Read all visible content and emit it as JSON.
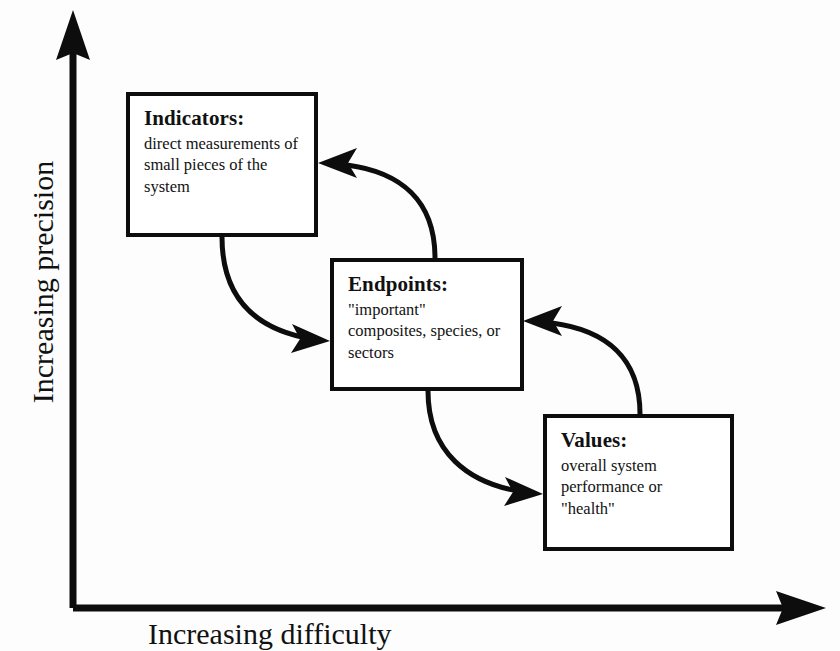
{
  "figure": {
    "background_color": "#fdfdfd",
    "ink_color": "#0d0d0d"
  },
  "axes": {
    "y": {
      "label": "Increasing precision",
      "arrow_direction": "up",
      "name": "y-axis"
    },
    "x": {
      "label": "Increasing difficulty",
      "arrow_direction": "right",
      "name": "x-axis"
    }
  },
  "boxes": [
    {
      "id": "indicators",
      "title": "Indicators:",
      "body": "direct measurements of small pieces of the system"
    },
    {
      "id": "endpoints",
      "title": "Endpoints:",
      "body": "\"important\" composites, species, or sectors"
    },
    {
      "id": "values",
      "title": "Values:",
      "body": "overall system performance or \"health\""
    }
  ],
  "connectors": [
    {
      "id": "indicators-to-endpoints",
      "from": "indicators",
      "to": "endpoints",
      "style": "curved-arrow"
    },
    {
      "id": "endpoints-to-indicators",
      "from": "endpoints",
      "to": "indicators",
      "style": "curved-arrow"
    },
    {
      "id": "endpoints-to-values",
      "from": "endpoints",
      "to": "values",
      "style": "curved-arrow"
    },
    {
      "id": "values-to-endpoints",
      "from": "values",
      "to": "endpoints",
      "style": "curved-arrow"
    }
  ]
}
